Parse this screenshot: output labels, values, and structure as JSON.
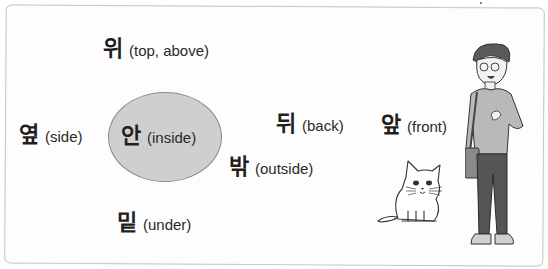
{
  "words": [
    {
      "id": "top",
      "korean": "위",
      "english": "(top, above)"
    },
    {
      "id": "side",
      "korean": "옆",
      "english": "(side)"
    },
    {
      "id": "inside",
      "korean": "안",
      "english": "(inside)"
    },
    {
      "id": "back",
      "korean": "뒤",
      "english": "(back)"
    },
    {
      "id": "front",
      "korean": "앞",
      "english": "(front)"
    },
    {
      "id": "outside",
      "korean": "밖",
      "english": "(outside)"
    },
    {
      "id": "under",
      "korean": "밑",
      "english": "(under)"
    }
  ],
  "illustrations": {
    "person": "boy-with-shoulder-bag",
    "animal": "white-cat"
  },
  "colors": {
    "ellipse_fill": "#cfcfcf",
    "text": "#1f1f1f",
    "shirt": "#b9b9b9",
    "pants": "#555555"
  }
}
